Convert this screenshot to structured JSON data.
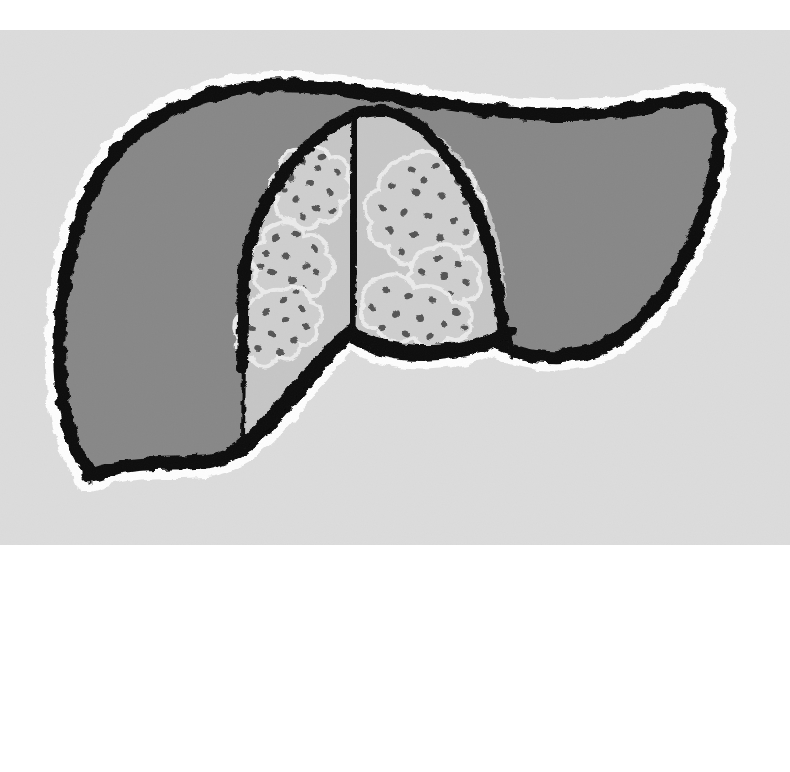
{
  "canvas": {
    "width": 790,
    "height": 772,
    "background_color": "#ffffff"
  },
  "panel": {
    "name": "illustration-panel",
    "background_color": "#dcdcdc",
    "x": 0,
    "y": 30,
    "width": 790,
    "height": 515
  },
  "illustration": {
    "subject": "liver-anatomy-diagram",
    "style": "hand-drawn-woodcut",
    "colors": {
      "background": "#dcdcdc",
      "organ_fill": "#888888",
      "central_region_fill": "#c6c6c6",
      "lesion_patch_fill": "#cfcfcf",
      "lesion_patch_outline": "#eaeaea",
      "speckle": "#565656",
      "ink": "#111111",
      "halo": "#fdfdfd"
    },
    "parts": [
      {
        "name": "liver-left-lobe",
        "label": "Left lobe of liver",
        "fill": "#888888"
      },
      {
        "name": "liver-right-lobe",
        "label": "Right lobe of liver",
        "fill": "#888888"
      },
      {
        "name": "central-cut-surface",
        "label": "Central cut surface / falciform region",
        "fill": "#c6c6c6"
      },
      {
        "name": "central-divider",
        "label": "Falciform ligament line"
      },
      {
        "name": "lesion-patches",
        "label": "Speckled lesion patches",
        "count": 7,
        "speckle_count": 168
      }
    ]
  }
}
